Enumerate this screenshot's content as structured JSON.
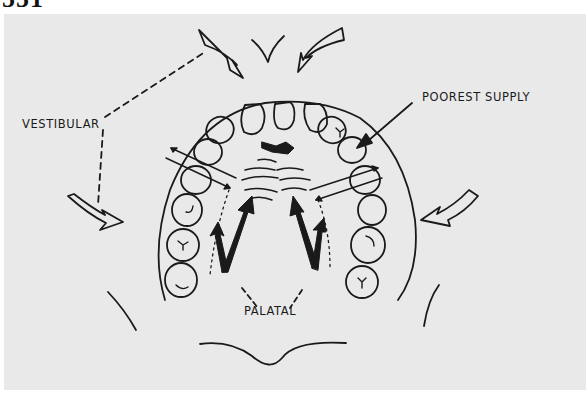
{
  "figure": {
    "number": "551"
  },
  "labels": {
    "vestibular": "VESTIBULAR",
    "poorest_supply": "POOREST SUPPLY",
    "palatal": "PALATAL"
  },
  "colors": {
    "background": "#e9e9e9",
    "ink": "#1a1a1a"
  }
}
